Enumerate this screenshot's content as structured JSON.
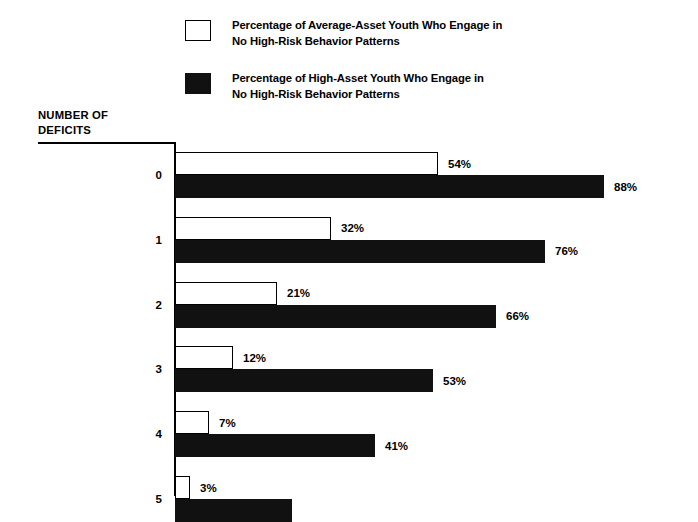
{
  "legend": {
    "items": [
      {
        "swatch": "open-square-swatch",
        "label": "Percentage of Average-Asset Youth Who Engage in\nNo High-Risk Behavior Patterns"
      },
      {
        "swatch": "filled-square-swatch",
        "label": "Percentage of High-Asset Youth Who Engage in\nNo High-Risk Behavior Patterns"
      }
    ]
  },
  "axis_title": "NUMBER OF\nDEFICITS",
  "colors": {
    "average_asset_fill": "#ffffff",
    "average_asset_stroke": "#000000",
    "high_asset_fill": "#111111",
    "text": "#000000",
    "background": "#ffffff"
  },
  "chart_data": {
    "type": "bar",
    "orientation": "horizontal",
    "title": "",
    "subtitle": "",
    "xlabel": "",
    "ylabel": "NUMBER OF DEFICITS",
    "categories": [
      "0",
      "1",
      "2",
      "3",
      "4",
      "5"
    ],
    "series": [
      {
        "name": "Percentage of Average-Asset Youth Who Engage in No High-Risk Behavior Patterns",
        "values": [
          54,
          32,
          21,
          12,
          7,
          3
        ],
        "labels": [
          "54%",
          "32%",
          "21%",
          "12%",
          "7%",
          "3%"
        ]
      },
      {
        "name": "Percentage of High-Asset Youth Who Engage in No High-Risk Behavior Patterns",
        "values": [
          88,
          76,
          66,
          53,
          41,
          24
        ],
        "labels": [
          "88%",
          "76%",
          "66%",
          "53%",
          "41%",
          ""
        ]
      }
    ],
    "xlim": [
      0,
      100
    ],
    "grid": false,
    "legend_position": "top"
  }
}
